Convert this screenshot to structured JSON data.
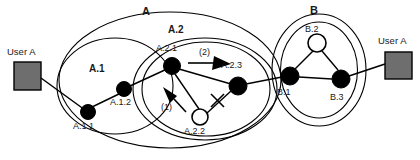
{
  "diagram": {
    "colors": {
      "stroke": "#000000",
      "node_fill": "#000000",
      "node_open_fill": "#ffffff",
      "user_box_fill": "#6e6e6e",
      "user_box_stroke": "#000000",
      "text": "#1a1a1a",
      "background": "#ffffff"
    },
    "groups": [
      {
        "id": "A",
        "label": "A",
        "label_x": 142,
        "label_y": 10
      },
      {
        "id": "A1",
        "label": "A.1",
        "label_x": 90,
        "label_y": 68
      },
      {
        "id": "A2",
        "label": "A.2",
        "label_x": 168,
        "label_y": 28
      },
      {
        "id": "B",
        "label": "B",
        "label_x": 311,
        "label_y": 8
      }
    ],
    "nodes": [
      {
        "id": "A.1.1",
        "label": "A.1.1",
        "type": "filled",
        "cx": 88,
        "cy": 112,
        "r": 7.5,
        "label_x": 73,
        "label_y": 122
      },
      {
        "id": "A.1.2",
        "label": "A.1.2",
        "type": "filled",
        "cx": 124,
        "cy": 89,
        "r": 7.5,
        "label_x": 110,
        "label_y": 99
      },
      {
        "id": "A.2.1",
        "label": "A.2.1",
        "type": "filled",
        "cx": 172,
        "cy": 66,
        "r": 8.5,
        "label_x": 157,
        "label_y": 45
      },
      {
        "id": "A.2.2",
        "label": "A.2.2",
        "type": "open",
        "cx": 200,
        "cy": 117,
        "r": 8,
        "label_x": 184,
        "label_y": 128
      },
      {
        "id": "A.2.3",
        "label": "A.2.3",
        "type": "filled",
        "cx": 238,
        "cy": 86,
        "r": 9,
        "label_x": 221,
        "label_y": 63
      },
      {
        "id": "B.1",
        "label": "B.1",
        "type": "filled",
        "cx": 290,
        "cy": 76,
        "r": 9,
        "label_x": 278,
        "label_y": 89
      },
      {
        "id": "B.2",
        "label": "B.2",
        "type": "open",
        "cx": 317,
        "cy": 43,
        "r": 9,
        "label_x": 306,
        "label_y": 26
      },
      {
        "id": "B.3",
        "label": "B.3",
        "type": "filled",
        "cx": 341,
        "cy": 79,
        "r": 9,
        "label_x": 330,
        "label_y": 94
      }
    ],
    "users": [
      {
        "id": "user-a-left",
        "label": "User A",
        "box_x": 14,
        "box_y": 62,
        "box_w": 27,
        "box_h": 28,
        "label_x": 8,
        "label_y": 50
      },
      {
        "id": "user-a-right",
        "label": "User A",
        "box_x": 385,
        "box_y": 52,
        "box_w": 27,
        "box_h": 27,
        "label_x": 379,
        "label_y": 39
      }
    ],
    "annotations": [
      {
        "id": "step-1",
        "label": "(1)",
        "x": 163,
        "y": 104,
        "arrow": "up-left"
      },
      {
        "id": "step-2",
        "label": "(2)",
        "x": 201,
        "y": 50,
        "arrow": "right"
      },
      {
        "id": "broken-link",
        "label": "",
        "x": 217,
        "y": 100,
        "arrow": "x-mark"
      }
    ],
    "edges": [
      {
        "from": "user-a-left",
        "to": "A.1.1"
      },
      {
        "from": "A.1.1",
        "to": "A.1.2"
      },
      {
        "from": "A.1.2",
        "to": "A.2.1"
      },
      {
        "from": "A.2.1",
        "to": "A.2.3"
      },
      {
        "from": "A.2.1",
        "to": "A.2.2"
      },
      {
        "from": "A.2.2",
        "to": "A.2.3",
        "state": "broken"
      },
      {
        "from": "A.2.3",
        "to": "B.1"
      },
      {
        "from": "B.1",
        "to": "B.2"
      },
      {
        "from": "B.2",
        "to": "B.3"
      },
      {
        "from": "B.1",
        "to": "B.3"
      },
      {
        "from": "B.3",
        "to": "user-a-right"
      }
    ]
  }
}
